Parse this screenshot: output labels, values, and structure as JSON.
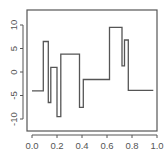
{
  "chart_data": {
    "type": "line",
    "style": "step",
    "title": "",
    "xlabel": "",
    "ylabel": "",
    "xlim": [
      -0.04,
      1.0
    ],
    "ylim": [
      -12.5,
      13.0
    ],
    "grid": false,
    "legend": null,
    "x_ticks": [
      0.0,
      0.2,
      0.4,
      0.6,
      0.8,
      1.0
    ],
    "x_tick_labels": [
      "0.0",
      "0.2",
      "0.4",
      "0.6",
      "0.8",
      "1.0"
    ],
    "y_ticks": [
      -10,
      -5,
      0,
      5,
      10
    ],
    "y_tick_labels": [
      "-10",
      "-5",
      "0",
      "5",
      "10"
    ],
    "series": [
      {
        "name": "step function",
        "color": "#555555",
        "steps": [
          {
            "x0": 0.0,
            "x1": 0.09,
            "y": -4.0
          },
          {
            "x0": 0.09,
            "x1": 0.13,
            "y": 6.5
          },
          {
            "x0": 0.13,
            "x1": 0.15,
            "y": -6.5
          },
          {
            "x0": 0.15,
            "x1": 0.2,
            "y": 1.0
          },
          {
            "x0": 0.2,
            "x1": 0.23,
            "y": -9.5
          },
          {
            "x0": 0.23,
            "x1": 0.38,
            "y": 3.8
          },
          {
            "x0": 0.38,
            "x1": 0.41,
            "y": -7.5
          },
          {
            "x0": 0.41,
            "x1": 0.62,
            "y": -1.6
          },
          {
            "x0": 0.62,
            "x1": 0.72,
            "y": 9.5
          },
          {
            "x0": 0.72,
            "x1": 0.74,
            "y": 1.3
          },
          {
            "x0": 0.74,
            "x1": 0.77,
            "y": 6.8
          },
          {
            "x0": 0.77,
            "x1": 0.97,
            "y": -3.9
          }
        ]
      }
    ]
  },
  "layout": {
    "frame": {
      "left": 27,
      "top": 10,
      "right": 157,
      "bottom": 131
    },
    "x_map": {
      "px_at_0": 32,
      "px_per_unit": 125
    },
    "y_map": {
      "px_at_0": 72,
      "px_per_unit": -4.7
    },
    "axis_color": "#555555",
    "line_color": "#555555"
  }
}
